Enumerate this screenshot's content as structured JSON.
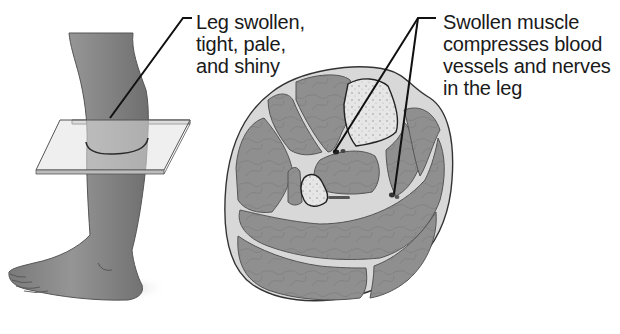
{
  "figure": {
    "panels": [
      {
        "id": "leg-side-view",
        "description": "Lower leg and foot with a cross-section plane at mid-calf"
      },
      {
        "id": "leg-cross-section",
        "description": "Transverse section of the leg showing muscle compartments, two bones, vessels and nerves"
      }
    ]
  },
  "labels": {
    "leg": "Leg swollen,\ntight, pale,\nand shiny",
    "muscle": "Swollen muscle\ncompresses blood\nvessels and nerves\nin the leg"
  },
  "colors": {
    "skin": "#8c8c8c",
    "skin_shadow": "#6e6e6e",
    "muscle": "#8f8f8f",
    "muscle_line": "#7a7a7a",
    "fascia": "#e4e4e4",
    "subcutaneous": "#d2d2d2",
    "bone": "#e8e8e8",
    "plane": "#dcdcdc",
    "outline": "#333333",
    "leader": "#111111",
    "text": "#1a1a1a"
  }
}
